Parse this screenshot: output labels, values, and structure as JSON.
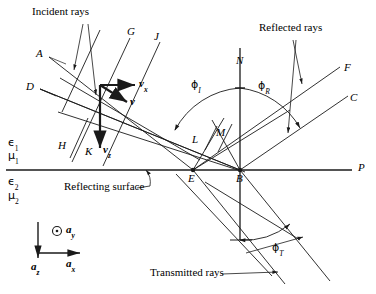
{
  "figure": {
    "background_color": "#ffffff",
    "line_color": "#1a1a1a",
    "width": 376,
    "height": 294
  },
  "annotations": {
    "incident_rays": "Incident rays",
    "reflected_rays": "Reflected rays",
    "transmitted_rays": "Transmitted rays",
    "reflecting_surface": "Reflecting surface"
  },
  "ray_labels": {
    "A": "A",
    "D": "D",
    "G": "G",
    "J": "J",
    "H": "H",
    "K": "K",
    "L": "L",
    "M": "M",
    "N": "N",
    "E": "E",
    "B": "B",
    "P": "P",
    "F": "F",
    "C": "C"
  },
  "vectors": {
    "v": "v",
    "v_x_base": "v",
    "v_x_sub": "x",
    "v_z_base": "v",
    "v_z_sub": "z"
  },
  "axes": {
    "a_y_base": "a",
    "a_y_sub": "y",
    "a_z_base": "a",
    "a_z_sub": "z",
    "a_x_base": "a",
    "a_x_sub": "x",
    "dot_icon": "circle-dot-out-of-page-icon"
  },
  "media": {
    "eps1_base": "ϵ",
    "eps1_sub": "1",
    "mu1_base": "μ",
    "mu1_sub": "1",
    "eps2_base": "ϵ",
    "eps2_sub": "2",
    "mu2_base": "μ",
    "mu2_sub": "2"
  },
  "angles": {
    "phi_I_base": "ϕ",
    "phi_I_sub": "I",
    "phi_R_base": "ϕ",
    "phi_R_sub": "R",
    "phi_T_base": "ϕ",
    "phi_T_sub": "T"
  }
}
